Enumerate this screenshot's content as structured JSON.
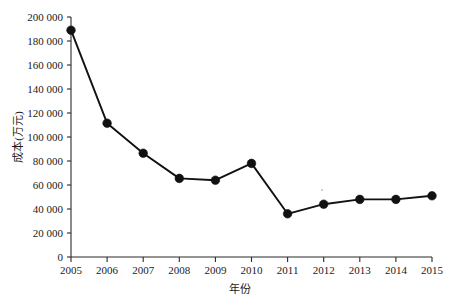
{
  "chart_data": {
    "type": "line",
    "title": "",
    "subtitle": "",
    "xlabel": "年份",
    "ylabel": "成本(万元)",
    "x": [
      2005,
      2006,
      2007,
      2008,
      2009,
      2010,
      2011,
      2012,
      2013,
      2014,
      2015
    ],
    "categories": [
      "2005",
      "2006",
      "2007",
      "2008",
      "2009",
      "2010",
      "2011",
      "2012",
      "2013",
      "2014",
      "2015"
    ],
    "values": [
      189000,
      111500,
      86500,
      65500,
      64000,
      78000,
      36000,
      44000,
      48000,
      48000,
      51000
    ],
    "series": [
      {
        "name": "成本",
        "values": [
          189000,
          111500,
          86500,
          65500,
          64000,
          78000,
          36000,
          44000,
          48000,
          48000,
          51000
        ]
      }
    ],
    "xlim": [
      2005,
      2015
    ],
    "ylim": [
      0,
      200000
    ],
    "ytick_values": [
      0,
      20000,
      40000,
      60000,
      80000,
      100000,
      120000,
      140000,
      160000,
      180000,
      200000
    ],
    "ytick_labels": [
      "0",
      "20 000",
      "40 000",
      "60 000",
      "80 000",
      "100 000",
      "120 000",
      "140 000",
      "160 000",
      "180 000",
      "200 000"
    ],
    "xtick_labels": [
      "2005",
      "2006",
      "2007",
      "2008",
      "2009",
      "2010",
      "2011",
      "2012",
      "2013",
      "2014",
      "2015"
    ],
    "grid": false,
    "legend": false,
    "legend_position": "none",
    "marker": "filled-circle",
    "line_color": "#111111",
    "marker_color": "#111111",
    "axis_color": "#2b2b2b",
    "background_color": "#ffffff"
  },
  "axis": {
    "y_title": "成本(万元)",
    "x_title": "年份"
  }
}
